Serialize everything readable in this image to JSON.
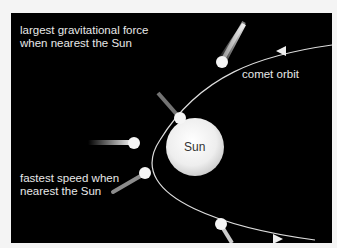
{
  "diagram": {
    "labels": {
      "gravity_line1": "largest gravitational force",
      "gravity_line2": "when nearest the Sun",
      "orbit": "comet orbit",
      "sun": "Sun",
      "speed_line1": "fastest speed when",
      "speed_line2": "nearest the Sun"
    },
    "colors": {
      "background": "#000000",
      "page": "#f4f4f4",
      "sun": "#eeeeee",
      "orbit_line": "#dddddd",
      "text": "#e8e8e8"
    },
    "comets": [
      {
        "name": "comet-upper-right",
        "x": 222,
        "y": 62
      },
      {
        "name": "comet-upper-left",
        "x": 179,
        "y": 118
      },
      {
        "name": "comet-left",
        "x": 134,
        "y": 143
      },
      {
        "name": "comet-lower-left",
        "x": 145,
        "y": 173
      },
      {
        "name": "comet-bottom",
        "x": 221,
        "y": 224
      }
    ]
  }
}
